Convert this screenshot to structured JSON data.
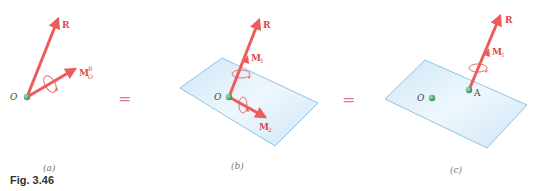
{
  "figure": {
    "caption": "Fig. 3.46",
    "colors": {
      "vector": "#ee5b5b",
      "vector_label": "#d94a4a",
      "point": "#3c9a5c",
      "plane_fill": "#dbeefa",
      "plane_edge": "#8fc3e3",
      "equals": "#e57a84",
      "text": "#444444"
    },
    "equals_sign": "=",
    "panels": [
      {
        "id": "a",
        "label": "(a)",
        "point_label": "O",
        "vectors": [
          {
            "name": "R",
            "label": "R"
          },
          {
            "name": "M_O^R",
            "label": "M",
            "superscript": "R",
            "subscript": "O"
          }
        ]
      },
      {
        "id": "b",
        "label": "(b)",
        "point_label": "O",
        "vectors": [
          {
            "name": "R",
            "label": "R"
          },
          {
            "name": "M1",
            "label": "M",
            "subscript": "1"
          },
          {
            "name": "M2",
            "label": "M",
            "subscript": "2"
          }
        ]
      },
      {
        "id": "c",
        "label": "(c)",
        "point_labels": [
          "O",
          "A"
        ],
        "vectors": [
          {
            "name": "R",
            "label": "R"
          },
          {
            "name": "M1",
            "label": "M",
            "subscript": "1"
          }
        ]
      }
    ]
  }
}
